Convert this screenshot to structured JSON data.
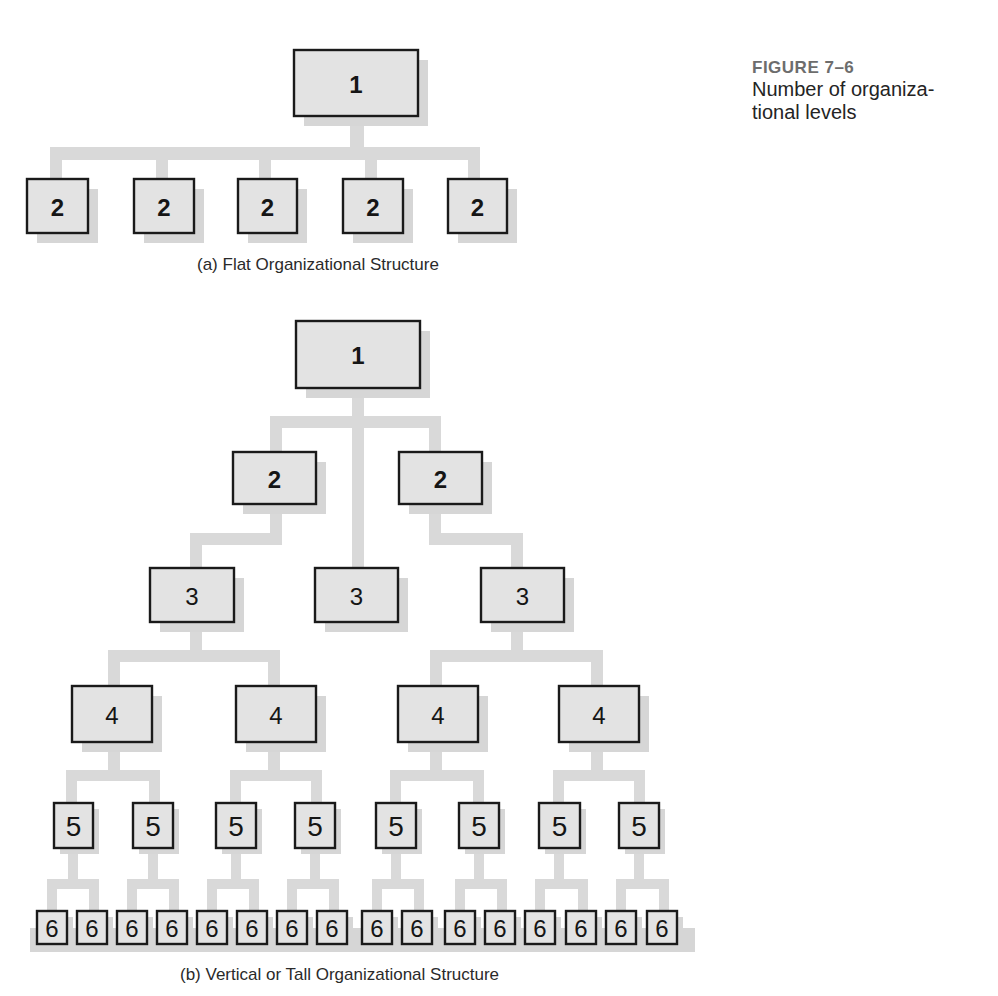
{
  "figure": {
    "number": "FIGURE 7–6",
    "description_line1": "Number of organiza-",
    "description_line2": "tional levels"
  },
  "captions": {
    "flat": "(a) Flat Organizational Structure",
    "tall": "(b) Vertical or Tall Organizational Structure"
  },
  "colors": {
    "box_fill": "#e3e3e3",
    "box_border": "#1a1a1a",
    "connector": "#d9d9d9",
    "shadow": "#d6d6d6",
    "figure_label": "#6d6d6d"
  },
  "flat_structure": {
    "levels": 2,
    "boxes": [
      {
        "label": "1",
        "level": 1,
        "x": 294,
        "y": 50,
        "w": 124,
        "h": 66
      },
      {
        "label": "2",
        "level": 2,
        "x": 27,
        "y": 179,
        "w": 61,
        "h": 54
      },
      {
        "label": "2",
        "level": 2,
        "x": 134,
        "y": 179,
        "w": 60,
        "h": 54
      },
      {
        "label": "2",
        "level": 2,
        "x": 238,
        "y": 179,
        "w": 59,
        "h": 54
      },
      {
        "label": "2",
        "level": 2,
        "x": 343,
        "y": 179,
        "w": 60,
        "h": 54
      },
      {
        "label": "2",
        "level": 2,
        "x": 448,
        "y": 179,
        "w": 59,
        "h": 54
      }
    ]
  },
  "tall_structure": {
    "levels": 6,
    "level_counts": [
      1,
      2,
      3,
      4,
      8,
      16
    ],
    "boxes": [
      {
        "label": "1",
        "level": 1,
        "x": 296,
        "y": 321,
        "w": 124,
        "h": 67
      },
      {
        "label": "2",
        "level": 2,
        "x": 233,
        "y": 452,
        "w": 83,
        "h": 52
      },
      {
        "label": "2",
        "level": 2,
        "x": 399,
        "y": 452,
        "w": 83,
        "h": 52
      },
      {
        "label": "3",
        "level": 3,
        "x": 150,
        "y": 568,
        "w": 84,
        "h": 54
      },
      {
        "label": "3",
        "level": 3,
        "x": 315,
        "y": 568,
        "w": 83,
        "h": 54
      },
      {
        "label": "3",
        "level": 3,
        "x": 481,
        "y": 568,
        "w": 83,
        "h": 54
      },
      {
        "label": "4",
        "level": 4,
        "x": 72,
        "y": 686,
        "w": 80,
        "h": 56
      },
      {
        "label": "4",
        "level": 4,
        "x": 236,
        "y": 686,
        "w": 80,
        "h": 56
      },
      {
        "label": "4",
        "level": 4,
        "x": 398,
        "y": 686,
        "w": 80,
        "h": 56
      },
      {
        "label": "4",
        "level": 4,
        "x": 559,
        "y": 686,
        "w": 80,
        "h": 56
      },
      {
        "label": "5",
        "level": 5,
        "x": 54,
        "y": 803,
        "w": 39,
        "h": 45
      },
      {
        "label": "5",
        "level": 5,
        "x": 133,
        "y": 803,
        "w": 40,
        "h": 45
      },
      {
        "label": "5",
        "level": 5,
        "x": 216,
        "y": 803,
        "w": 40,
        "h": 45
      },
      {
        "label": "5",
        "level": 5,
        "x": 295,
        "y": 803,
        "w": 40,
        "h": 45
      },
      {
        "label": "5",
        "level": 5,
        "x": 376,
        "y": 803,
        "w": 40,
        "h": 45
      },
      {
        "label": "5",
        "level": 5,
        "x": 459,
        "y": 803,
        "w": 40,
        "h": 45
      },
      {
        "label": "5",
        "level": 5,
        "x": 539,
        "y": 803,
        "w": 41,
        "h": 45
      },
      {
        "label": "5",
        "level": 5,
        "x": 619,
        "y": 803,
        "w": 40,
        "h": 45
      },
      {
        "label": "6",
        "level": 6,
        "x": 37,
        "y": 911,
        "w": 30,
        "h": 33
      },
      {
        "label": "6",
        "level": 6,
        "x": 77,
        "y": 911,
        "w": 30,
        "h": 33
      },
      {
        "label": "6",
        "level": 6,
        "x": 117,
        "y": 911,
        "w": 30,
        "h": 33
      },
      {
        "label": "6",
        "level": 6,
        "x": 157,
        "y": 911,
        "w": 30,
        "h": 33
      },
      {
        "label": "6",
        "level": 6,
        "x": 197,
        "y": 911,
        "w": 30,
        "h": 33
      },
      {
        "label": "6",
        "level": 6,
        "x": 237,
        "y": 911,
        "w": 30,
        "h": 33
      },
      {
        "label": "6",
        "level": 6,
        "x": 277,
        "y": 911,
        "w": 30,
        "h": 33
      },
      {
        "label": "6",
        "level": 6,
        "x": 317,
        "y": 911,
        "w": 30,
        "h": 33
      },
      {
        "label": "6",
        "level": 6,
        "x": 362,
        "y": 911,
        "w": 30,
        "h": 33
      },
      {
        "label": "6",
        "level": 6,
        "x": 402,
        "y": 911,
        "w": 30,
        "h": 33
      },
      {
        "label": "6",
        "level": 6,
        "x": 445,
        "y": 911,
        "w": 30,
        "h": 33
      },
      {
        "label": "6",
        "level": 6,
        "x": 485,
        "y": 911,
        "w": 30,
        "h": 33
      },
      {
        "label": "6",
        "level": 6,
        "x": 525,
        "y": 911,
        "w": 30,
        "h": 33
      },
      {
        "label": "6",
        "level": 6,
        "x": 566,
        "y": 911,
        "w": 30,
        "h": 33
      },
      {
        "label": "6",
        "level": 6,
        "x": 606,
        "y": 911,
        "w": 30,
        "h": 33
      },
      {
        "label": "6",
        "level": 6,
        "x": 647,
        "y": 911,
        "w": 30,
        "h": 33
      }
    ]
  },
  "connectors": [
    {
      "x": 350,
      "y": 116,
      "w": 14,
      "h": 34
    },
    {
      "x": 50,
      "y": 147,
      "w": 430,
      "h": 13
    },
    {
      "x": 50,
      "y": 147,
      "w": 12,
      "h": 32
    },
    {
      "x": 156,
      "y": 147,
      "w": 12,
      "h": 32
    },
    {
      "x": 259,
      "y": 147,
      "w": 12,
      "h": 32
    },
    {
      "x": 365,
      "y": 147,
      "w": 12,
      "h": 32
    },
    {
      "x": 468,
      "y": 147,
      "w": 12,
      "h": 32
    },
    {
      "x": 352,
      "y": 388,
      "w": 12,
      "h": 180
    },
    {
      "x": 270,
      "y": 416,
      "w": 170,
      "h": 12
    },
    {
      "x": 270,
      "y": 416,
      "w": 12,
      "h": 36
    },
    {
      "x": 429,
      "y": 416,
      "w": 12,
      "h": 36
    },
    {
      "x": 270,
      "y": 504,
      "w": 12,
      "h": 36
    },
    {
      "x": 190,
      "y": 533,
      "w": 92,
      "h": 12
    },
    {
      "x": 190,
      "y": 533,
      "w": 12,
      "h": 35
    },
    {
      "x": 429,
      "y": 504,
      "w": 12,
      "h": 36
    },
    {
      "x": 429,
      "y": 533,
      "w": 94,
      "h": 12
    },
    {
      "x": 511,
      "y": 533,
      "w": 12,
      "h": 35
    },
    {
      "x": 190,
      "y": 622,
      "w": 12,
      "h": 34
    },
    {
      "x": 108,
      "y": 650,
      "w": 172,
      "h": 12
    },
    {
      "x": 108,
      "y": 650,
      "w": 12,
      "h": 36
    },
    {
      "x": 268,
      "y": 650,
      "w": 12,
      "h": 36
    },
    {
      "x": 511,
      "y": 622,
      "w": 12,
      "h": 34
    },
    {
      "x": 430,
      "y": 650,
      "w": 173,
      "h": 12
    },
    {
      "x": 430,
      "y": 650,
      "w": 12,
      "h": 36
    },
    {
      "x": 591,
      "y": 650,
      "w": 12,
      "h": 36
    },
    {
      "x": 108,
      "y": 742,
      "w": 12,
      "h": 30
    },
    {
      "x": 66,
      "y": 770,
      "w": 94,
      "h": 11
    },
    {
      "x": 66,
      "y": 770,
      "w": 11,
      "h": 33
    },
    {
      "x": 149,
      "y": 770,
      "w": 11,
      "h": 33
    },
    {
      "x": 268,
      "y": 742,
      "w": 12,
      "h": 30
    },
    {
      "x": 230,
      "y": 770,
      "w": 92,
      "h": 11
    },
    {
      "x": 230,
      "y": 770,
      "w": 11,
      "h": 33
    },
    {
      "x": 311,
      "y": 770,
      "w": 11,
      "h": 33
    },
    {
      "x": 430,
      "y": 742,
      "w": 12,
      "h": 30
    },
    {
      "x": 390,
      "y": 770,
      "w": 94,
      "h": 11
    },
    {
      "x": 390,
      "y": 770,
      "w": 11,
      "h": 33
    },
    {
      "x": 473,
      "y": 770,
      "w": 11,
      "h": 33
    },
    {
      "x": 591,
      "y": 742,
      "w": 12,
      "h": 30
    },
    {
      "x": 553,
      "y": 770,
      "w": 92,
      "h": 11
    },
    {
      "x": 553,
      "y": 770,
      "w": 11,
      "h": 33
    },
    {
      "x": 634,
      "y": 770,
      "w": 11,
      "h": 33
    },
    {
      "x": 68,
      "y": 848,
      "w": 10,
      "h": 33
    },
    {
      "x": 47,
      "y": 879,
      "w": 52,
      "h": 10
    },
    {
      "x": 47,
      "y": 879,
      "w": 10,
      "h": 32
    },
    {
      "x": 89,
      "y": 879,
      "w": 10,
      "h": 32
    },
    {
      "x": 148,
      "y": 848,
      "w": 10,
      "h": 33
    },
    {
      "x": 127,
      "y": 879,
      "w": 52,
      "h": 10
    },
    {
      "x": 127,
      "y": 879,
      "w": 10,
      "h": 32
    },
    {
      "x": 169,
      "y": 879,
      "w": 10,
      "h": 32
    },
    {
      "x": 231,
      "y": 848,
      "w": 10,
      "h": 33
    },
    {
      "x": 207,
      "y": 879,
      "w": 52,
      "h": 10
    },
    {
      "x": 207,
      "y": 879,
      "w": 10,
      "h": 32
    },
    {
      "x": 249,
      "y": 879,
      "w": 10,
      "h": 32
    },
    {
      "x": 310,
      "y": 848,
      "w": 10,
      "h": 33
    },
    {
      "x": 287,
      "y": 879,
      "w": 52,
      "h": 10
    },
    {
      "x": 287,
      "y": 879,
      "w": 10,
      "h": 32
    },
    {
      "x": 329,
      "y": 879,
      "w": 10,
      "h": 32
    },
    {
      "x": 391,
      "y": 848,
      "w": 10,
      "h": 33
    },
    {
      "x": 372,
      "y": 879,
      "w": 52,
      "h": 10
    },
    {
      "x": 372,
      "y": 879,
      "w": 10,
      "h": 32
    },
    {
      "x": 414,
      "y": 879,
      "w": 10,
      "h": 32
    },
    {
      "x": 474,
      "y": 848,
      "w": 10,
      "h": 33
    },
    {
      "x": 455,
      "y": 879,
      "w": 52,
      "h": 10
    },
    {
      "x": 455,
      "y": 879,
      "w": 10,
      "h": 32
    },
    {
      "x": 497,
      "y": 879,
      "w": 10,
      "h": 32
    },
    {
      "x": 554,
      "y": 848,
      "w": 10,
      "h": 33
    },
    {
      "x": 535,
      "y": 879,
      "w": 53,
      "h": 10
    },
    {
      "x": 535,
      "y": 879,
      "w": 10,
      "h": 32
    },
    {
      "x": 578,
      "y": 879,
      "w": 10,
      "h": 32
    },
    {
      "x": 634,
      "y": 848,
      "w": 10,
      "h": 33
    },
    {
      "x": 616,
      "y": 879,
      "w": 53,
      "h": 10
    },
    {
      "x": 616,
      "y": 879,
      "w": 10,
      "h": 32
    },
    {
      "x": 659,
      "y": 879,
      "w": 10,
      "h": 32
    }
  ],
  "baseline_band": {
    "x": 30,
    "y": 928,
    "w": 665,
    "h": 24
  }
}
